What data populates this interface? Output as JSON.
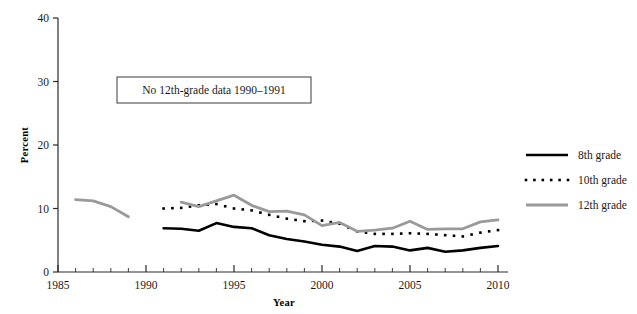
{
  "chart_data": {
    "type": "line",
    "title": "",
    "xlabel": "Year",
    "ylabel": "Percent",
    "xlim": [
      1985,
      2010
    ],
    "ylim": [
      0,
      40
    ],
    "ytick_labels": [
      "0",
      "10",
      "20",
      "30",
      "40"
    ],
    "yticks": [
      0,
      10,
      20,
      30,
      40
    ],
    "xtick_labels": [
      "1985",
      "1990",
      "1995",
      "2000",
      "2005",
      "2010"
    ],
    "xticks": [
      1985,
      1990,
      1995,
      2000,
      2005,
      2010
    ],
    "x_minor_tick_interval": 1,
    "grid": false,
    "legend_position": "right",
    "annotations": [
      {
        "name": "missing-data-note",
        "text": "No 12th-grade data 1990–1991",
        "boxed": true
      }
    ],
    "series": [
      {
        "name": "8th grade",
        "style": "solid",
        "color": "#000000",
        "linewidth": 2.6,
        "x": [
          1991,
          1992,
          1993,
          1994,
          1995,
          1996,
          1997,
          1998,
          1999,
          2000,
          2001,
          2002,
          2003,
          2004,
          2005,
          2006,
          2007,
          2008,
          2009,
          2010
        ],
        "values": [
          6.9,
          6.8,
          6.5,
          7.7,
          7.1,
          6.9,
          5.8,
          5.2,
          4.8,
          4.3,
          4.0,
          3.3,
          4.1,
          4.0,
          3.4,
          3.8,
          3.2,
          3.4,
          3.8,
          4.1
        ]
      },
      {
        "name": "10th grade",
        "style": "dotted",
        "color": "#000000",
        "linewidth": 2.6,
        "x": [
          1991,
          1992,
          1993,
          1994,
          1995,
          1996,
          1997,
          1998,
          1999,
          2000,
          2001,
          2002,
          2003,
          2004,
          2005,
          2006,
          2007,
          2008,
          2009,
          2010
        ],
        "values": [
          10.0,
          10.1,
          10.5,
          10.7,
          10.0,
          9.7,
          9.0,
          8.4,
          8.0,
          8.1,
          7.6,
          6.4,
          6.0,
          6.0,
          6.1,
          6.0,
          5.8,
          5.6,
          6.2,
          6.6
        ]
      },
      {
        "name": "12th grade",
        "style": "solid",
        "color": "#9a9a9a",
        "linewidth": 2.8,
        "segments": [
          {
            "x": [
              1986,
              1987,
              1988,
              1989
            ],
            "values": [
              11.4,
              11.2,
              10.3,
              8.7
            ]
          },
          {
            "x": [
              1992,
              1993,
              1994,
              1995,
              1996,
              1997,
              1998,
              1999,
              2000,
              2001,
              2002,
              2003,
              2004,
              2005,
              2006,
              2007,
              2008,
              2009,
              2010
            ],
            "values": [
              11.0,
              10.3,
              11.2,
              12.1,
              10.5,
              9.5,
              9.6,
              9.0,
              7.3,
              7.8,
              6.4,
              6.6,
              6.9,
              8.0,
              6.7,
              6.8,
              6.8,
              7.9,
              8.2
            ]
          }
        ]
      }
    ]
  },
  "legend": {
    "entries": [
      {
        "label": "8th grade",
        "swatch": "solid-black-line"
      },
      {
        "label": "10th grade",
        "swatch": "dotted-black-line"
      },
      {
        "label": "12th grade",
        "swatch": "solid-gray-line"
      }
    ]
  },
  "colors": {
    "grade8": "#000000",
    "grade10": "#000000",
    "grade12": "#9a9a9a",
    "axis": "#2b2b2b",
    "background": "#ffffff"
  }
}
